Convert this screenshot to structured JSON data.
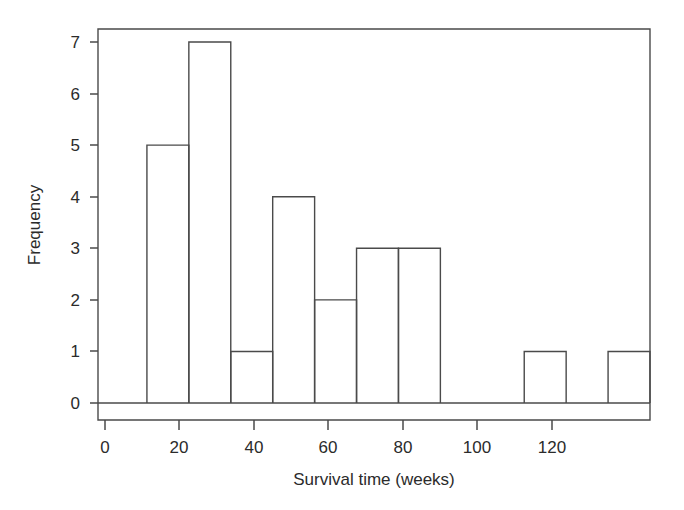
{
  "chart_data": {
    "type": "bar",
    "subtype": "histogram",
    "title": "",
    "subtitle": "",
    "xlabel": "Survival time (weeks)",
    "ylabel": "Frequency",
    "xlim": [
      0,
      130
    ],
    "ylim": [
      0,
      7
    ],
    "xticks": [
      0,
      20,
      40,
      60,
      80,
      100,
      120
    ],
    "xtick_labels": [
      "0",
      "20",
      "40",
      "60",
      "80",
      "100",
      "120"
    ],
    "yticks": [
      0,
      1,
      2,
      3,
      4,
      5,
      6,
      7
    ],
    "ytick_labels": [
      "0",
      "1",
      "2",
      "3",
      "4",
      "5",
      "6",
      "7"
    ],
    "bin_width": 10,
    "bin_edges": [
      10,
      20,
      30,
      40,
      50,
      60,
      70,
      80,
      90,
      100,
      110,
      120,
      130
    ],
    "categories": [
      "10-20",
      "20-30",
      "30-40",
      "40-50",
      "50-60",
      "60-70",
      "70-80",
      "80-90",
      "90-100",
      "100-110",
      "110-120",
      "120-130"
    ],
    "values": [
      5,
      7,
      1,
      4,
      2,
      3,
      3,
      0,
      0,
      1,
      0,
      1
    ],
    "bars": [
      {
        "x0": 10,
        "x1": 20,
        "value": 5
      },
      {
        "x0": 20,
        "x1": 30,
        "value": 7
      },
      {
        "x0": 30,
        "x1": 40,
        "value": 1
      },
      {
        "x0": 40,
        "x1": 50,
        "value": 4
      },
      {
        "x0": 50,
        "x1": 60,
        "value": 2
      },
      {
        "x0": 60,
        "x1": 70,
        "value": 3
      },
      {
        "x0": 70,
        "x1": 80,
        "value": 3
      },
      {
        "x0": 100,
        "x1": 110,
        "value": 1
      },
      {
        "x0": 120,
        "x1": 130,
        "value": 1
      }
    ],
    "grid": false,
    "legend": false,
    "legend_position": "none",
    "bar_fill": "#ffffff",
    "bar_stroke": "#4a4a4a",
    "axis_color": "#4a4a4a",
    "background": "#ffffff",
    "frame": "box"
  },
  "figure": {
    "background_color": "#ffffff"
  }
}
